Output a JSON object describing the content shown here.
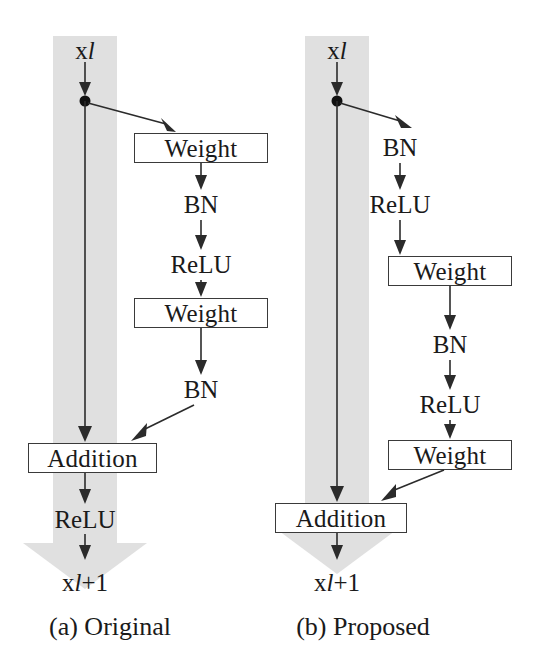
{
  "figure": {
    "width": 543,
    "height": 666,
    "background": "#ffffff",
    "shortcut_band_color": "#e0e0e0",
    "box_border_color": "#3a3a3a",
    "edge_color": "#2b2b2b",
    "text_color": "#1a1a1a"
  },
  "panels": [
    {
      "id": "original",
      "caption": "(a) Original",
      "input_label": {
        "base": "x",
        "sub": "l"
      },
      "output_label": {
        "base": "x",
        "sub": "l",
        "suffix": "+1"
      },
      "shortcut": {
        "type": "identity",
        "band_x": 53,
        "band_width": 64,
        "band_top": 36,
        "band_bottom": 543,
        "arrow_head_center_x": 85,
        "arrow_head_top": 543,
        "arrow_head_height": 46
      },
      "residual_branch": [
        {
          "kind": "box",
          "label": "Weight",
          "x": 134,
          "y": 133,
          "w": 134,
          "h": 30
        },
        {
          "kind": "label",
          "label": "BN",
          "cx": 201,
          "cy": 205
        },
        {
          "kind": "label",
          "label": "ReLU",
          "cx": 201,
          "cy": 265
        },
        {
          "kind": "box",
          "label": "Weight",
          "x": 134,
          "y": 298,
          "w": 134,
          "h": 30
        },
        {
          "kind": "label",
          "label": "BN",
          "cx": 201,
          "cy": 390
        }
      ],
      "merge": {
        "kind": "box",
        "label": "Addition",
        "x": 28,
        "y": 443,
        "w": 129,
        "h": 30
      },
      "post_merge": [
        {
          "kind": "label",
          "label": "ReLU",
          "cx": 85,
          "cy": 520
        }
      ],
      "branch_point_y": 100,
      "branch_target": "weight-box-1",
      "caption_cx": 110,
      "caption_y": 614
    },
    {
      "id": "proposed",
      "caption": "(b) Proposed",
      "input_label": {
        "base": "x",
        "sub": "l"
      },
      "output_label": {
        "base": "x",
        "sub": "l",
        "suffix": "+1"
      },
      "shortcut": {
        "type": "identity",
        "band_x": 305,
        "band_width": 64,
        "band_top": 36,
        "band_bottom": 528,
        "arrow_head_center_x": 337,
        "arrow_head_top": 528,
        "arrow_head_height": 46
      },
      "residual_branch": [
        {
          "kind": "label",
          "label": "BN",
          "cx": 400,
          "cy": 148
        },
        {
          "kind": "label",
          "label": "ReLU",
          "cx": 400,
          "cy": 205
        },
        {
          "kind": "box",
          "label": "Weight",
          "x": 388,
          "y": 256,
          "w": 124,
          "h": 30
        },
        {
          "kind": "label",
          "label": "BN",
          "cx": 450,
          "cy": 345
        },
        {
          "kind": "label",
          "label": "ReLU",
          "cx": 450,
          "cy": 405
        },
        {
          "kind": "box",
          "label": "Weight",
          "x": 388,
          "y": 440,
          "w": 124,
          "h": 30
        }
      ],
      "merge": {
        "kind": "box",
        "label": "Addition",
        "x": 275,
        "y": 503,
        "w": 132,
        "h": 30
      },
      "post_merge": [],
      "branch_point_y": 100,
      "branch_target": "open-space",
      "caption_cx": 363,
      "caption_y": 614
    }
  ],
  "node_kinds": {
    "box": "bordered-rectangle",
    "label": "plain-text"
  },
  "icons": {
    "junction_dot": "junction-dot",
    "arrow_head": "arrow-head-triangle"
  }
}
